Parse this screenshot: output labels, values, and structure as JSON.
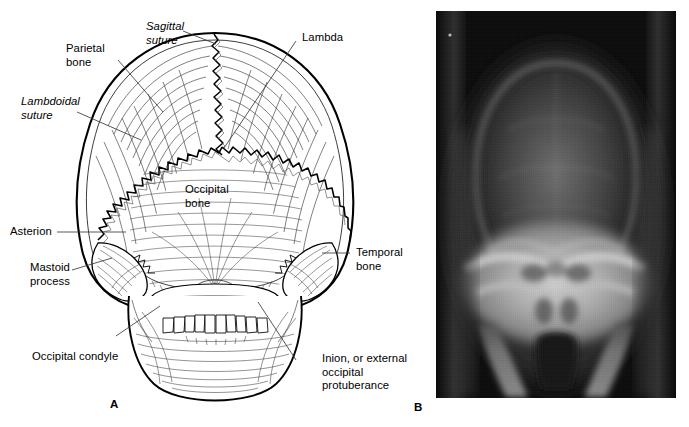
{
  "figure": {
    "panels": [
      {
        "letter": "A",
        "type": "line-drawing",
        "subject": "posterior view of skull"
      },
      {
        "letter": "B",
        "type": "radiograph",
        "subject": "posteroanterior skull radiograph"
      }
    ]
  },
  "labels": {
    "sagittal_suture": "Sagittal\nsuture",
    "parietal_bone": "Parietal\nbone",
    "lambdoidal_suture": "Lambdoidal\nsuture",
    "lambda": "Lambda",
    "occipital_bone": "Occipital\nbone",
    "asterion": "Asterion",
    "mastoid_process": "Mastoid\nprocess",
    "temporal_bone": "Temporal\nbone",
    "occipital_condyle": "Occipital condyle",
    "inion": "Inion, or external\noccipital\nprotuberance"
  },
  "panel_letters": {
    "a": "A",
    "b": "B"
  },
  "colors": {
    "ink": "#000000",
    "paper": "#ffffff",
    "leader_line": "#3a3a3a",
    "xray_background": "#0b0b0b",
    "xray_vault": "#3a3a3a",
    "xray_bone_bright": "#c8c8c8",
    "xray_soft_tissue": "#7a7a7a"
  }
}
